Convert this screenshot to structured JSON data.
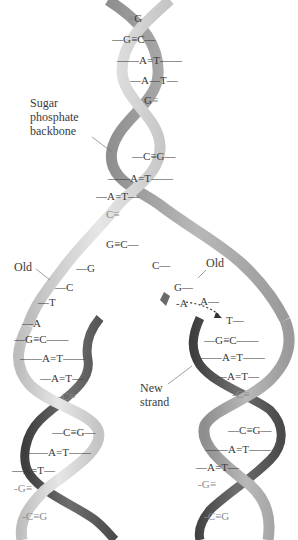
{
  "labels": {
    "backbone": [
      "Sugar",
      "phosphate",
      "backbone"
    ],
    "old_left": "Old",
    "old_right": "Old",
    "new_strand": [
      "New",
      "strand"
    ],
    "incoming_nucleotide": "A"
  },
  "parent_helix": {
    "pairs": [
      {
        "left": "",
        "bond": "≡",
        "right": "G",
        "dim": true
      },
      {
        "left": "G",
        "bond": "≡",
        "right": "C"
      },
      {
        "left": "A",
        "bond": "=",
        "right": "T"
      },
      {
        "left": "A",
        "bond": "—",
        "right": "T"
      },
      {
        "left": "G",
        "bond": "≡",
        "right": "",
        "dim": true
      },
      {
        "left": "C",
        "bond": "≡",
        "right": "G"
      },
      {
        "left": "A",
        "bond": "=",
        "right": "T"
      },
      {
        "left": "A",
        "bond": "=",
        "right": "T"
      },
      {
        "left": "C",
        "bond": "≡",
        "right": "",
        "dim": true
      },
      {
        "left": "G",
        "bond": "≡",
        "right": "C"
      }
    ]
  },
  "fork": {
    "left_template": [
      "G",
      "C",
      "T",
      "A"
    ],
    "right_template": [
      "C",
      "G",
      "A",
      "T"
    ]
  },
  "left_daughter": {
    "pairs": [
      {
        "left": "G",
        "bond": "≡",
        "right": "C"
      },
      {
        "left": "A",
        "bond": "=",
        "right": "T"
      },
      {
        "left": "A",
        "bond": "=",
        "right": "T"
      },
      {
        "left": "C",
        "bond": "≡",
        "right": "",
        "dim": true
      },
      {
        "left": "C",
        "bond": "≡",
        "right": "G"
      },
      {
        "left": "A",
        "bond": "=",
        "right": "T"
      },
      {
        "left": "A",
        "bond": "=",
        "right": "T"
      },
      {
        "left": "G",
        "bond": "≡",
        "right": "",
        "dim": true
      },
      {
        "left": "C",
        "bond": "≡",
        "right": "G",
        "dim": true
      }
    ]
  },
  "right_daughter": {
    "pairs": [
      {
        "left": "G",
        "bond": "≡",
        "right": "C"
      },
      {
        "left": "A",
        "bond": "=",
        "right": "T"
      },
      {
        "left": "A",
        "bond": "=",
        "right": "T"
      },
      {
        "left": "C",
        "bond": "≡",
        "right": "",
        "dim": true
      },
      {
        "left": "C",
        "bond": "≡",
        "right": "G"
      },
      {
        "left": "A",
        "bond": "=",
        "right": "T"
      },
      {
        "left": "A",
        "bond": "=",
        "right": "T"
      },
      {
        "left": "G",
        "bond": "≡",
        "right": "",
        "dim": true
      },
      {
        "left": "C",
        "bond": "≡",
        "right": "G",
        "dim": true
      }
    ]
  },
  "colors": {
    "old_strand_light": "#d4d4d4",
    "old_strand_mid": "#a8a8a8",
    "new_strand_dark": "#5a5a5a",
    "text": "#3a3a3a",
    "background": "#ffffff"
  }
}
